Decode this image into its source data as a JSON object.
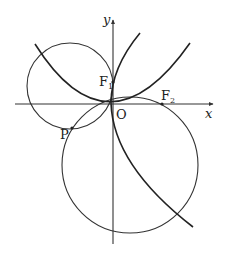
{
  "diagram": {
    "axes": {
      "x_label": "x",
      "y_label": "y",
      "origin_label": "O"
    },
    "points": {
      "F1": {
        "label": "F",
        "sub": "1"
      },
      "F2": {
        "label": "F",
        "sub": "2"
      },
      "P": {
        "label": "P"
      }
    },
    "curves": [
      {
        "name": "upward-parabola",
        "description": "parabola opening upward, vertex near origin"
      },
      {
        "name": "rightward-parabola",
        "description": "parabola opening rightward, vertex near origin"
      }
    ],
    "circles": [
      {
        "name": "small-circle",
        "description": "circle in upper-left, tangent near y-axis, passing through P"
      },
      {
        "name": "large-circle",
        "description": "large circle below x-axis, passing through P and F2"
      }
    ]
  }
}
